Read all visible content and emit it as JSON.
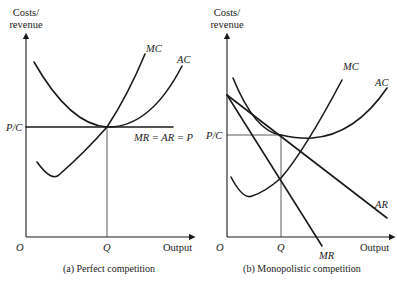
{
  "panels": [
    {
      "caption": "(a) Perfect competition",
      "y_axis_label_line1": "Costs/",
      "y_axis_label_line2": "revenue",
      "x_axis_label": "Output",
      "origin_label": "O",
      "quantity_label": "Q",
      "price_cost_label": "P/C",
      "curves": {
        "mc": "MC",
        "ac": "AC",
        "demand": "MR = AR = P"
      }
    },
    {
      "caption": "(b) Monopolistic competition",
      "y_axis_label_line1": "Costs/",
      "y_axis_label_line2": "revenue",
      "x_axis_label": "Output",
      "origin_label": "O",
      "quantity_label": "Q",
      "price_cost_label": "P/C",
      "curves": {
        "mc": "MC",
        "ac": "AC",
        "ar": "AR",
        "mr": "MR"
      }
    }
  ]
}
